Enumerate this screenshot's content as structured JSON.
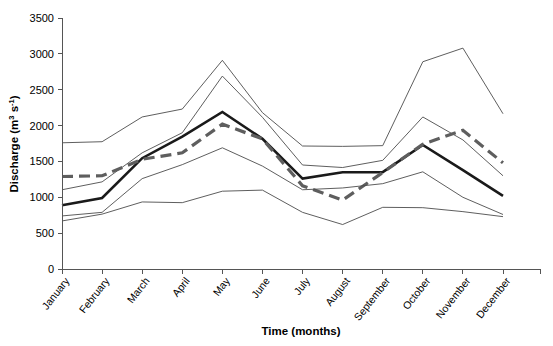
{
  "chart_data": {
    "type": "line",
    "title": "",
    "xlabel": "Time (months)",
    "ylabel": "Discharge (m3 s-1)",
    "ylabel_parts": {
      "prefix": "Discharge (m",
      "sup1": "3",
      "mid": " s",
      "sup2": "-1",
      "suffix": ")"
    },
    "categories": [
      "January",
      "February",
      "March",
      "April",
      "May",
      "June",
      "July",
      "August",
      "September",
      "October",
      "November",
      "December"
    ],
    "yticks": [
      0,
      500,
      1000,
      1500,
      2000,
      2500,
      3000,
      3500
    ],
    "ylim": [
      0,
      3500
    ],
    "grid": false,
    "legend": "none",
    "series": [
      {
        "name": "upper-envelope-thin",
        "style": "thin-solid",
        "color": "#4c4c4c",
        "values": [
          1760,
          1775,
          2120,
          2230,
          2910,
          2180,
          1715,
          1710,
          1720,
          2890,
          3080,
          2165
        ]
      },
      {
        "name": "upper-quartile-thin",
        "style": "thin-solid",
        "color": "#4c4c4c",
        "values": [
          1105,
          1215,
          1620,
          1900,
          2690,
          2115,
          1450,
          1415,
          1515,
          2120,
          1800,
          1300
        ]
      },
      {
        "name": "mean-bold",
        "style": "bold-solid",
        "color": "#1a1a1a",
        "values": [
          890,
          990,
          1545,
          1845,
          2190,
          1815,
          1260,
          1350,
          1350,
          1730,
          1380,
          1020
        ]
      },
      {
        "name": "median-dashed",
        "style": "dashed",
        "color": "#5e5e5e",
        "values": [
          1290,
          1300,
          1530,
          1620,
          2020,
          1815,
          1160,
          960,
          1345,
          1740,
          1935,
          1480
        ]
      },
      {
        "name": "lower-quartile-thin",
        "style": "thin-solid",
        "color": "#4c4c4c",
        "values": [
          740,
          790,
          1260,
          1455,
          1690,
          1435,
          1105,
          1130,
          1190,
          1355,
          1000,
          760
        ]
      },
      {
        "name": "lower-envelope-thin",
        "style": "thin-solid",
        "color": "#4c4c4c",
        "values": [
          670,
          765,
          935,
          925,
          1085,
          1100,
          790,
          620,
          860,
          855,
          800,
          730
        ]
      }
    ]
  },
  "plot_geometry": {
    "left": 62,
    "right": 540,
    "top": 18,
    "bottom": 269
  }
}
